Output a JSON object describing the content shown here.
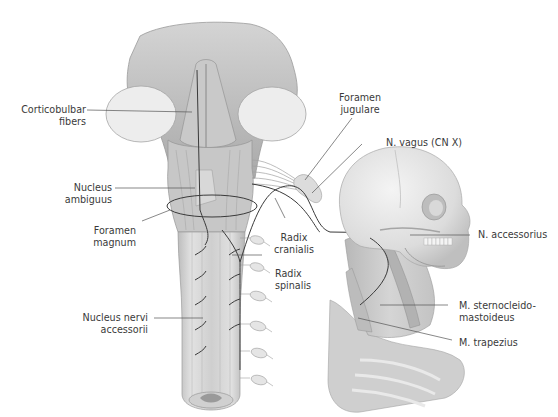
{
  "figure": {
    "type": "anatomical illustration",
    "colors": {
      "background": "#ffffff",
      "tissue_light": "#e6e6e6",
      "tissue_mid": "#c4c4c4",
      "tissue_dark": "#8f8f8f",
      "nerve": "#3a3a3a",
      "leader_line": "#555555",
      "label_text": "#3a3a3a"
    }
  },
  "labels": {
    "corticobulbar": {
      "line1": "Corticobulbar",
      "line2": "fibers"
    },
    "nucleus_ambiguus": {
      "line1": "Nucleus",
      "line2": "ambiguus"
    },
    "foramen_magnum": {
      "line1": "Foramen",
      "line2": "magnum"
    },
    "nucleus_nervi_accessorii": {
      "line1": "Nucleus nervi",
      "line2": "accessorii"
    },
    "foramen_jugulare": {
      "line1": "Foramen",
      "line2": "jugulare"
    },
    "n_vagus": {
      "line1": "N. vagus (CN X)"
    },
    "radix_cranialis": {
      "line1": "Radix",
      "line2": "cranialis"
    },
    "radix_spinalis": {
      "line1": "Radix",
      "line2": "spinalis"
    },
    "n_accessorius": {
      "line1": "N. accessorius"
    },
    "m_sternocleidomastoideus": {
      "line1": "M. sternocleido-",
      "line2": "mastoideus"
    },
    "m_trapezius": {
      "line1": "M. trapezius"
    }
  }
}
